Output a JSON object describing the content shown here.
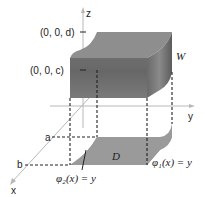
{
  "diagram": {
    "type": "3d-solid-region",
    "axes": {
      "x": "x",
      "y": "y",
      "z": "z"
    },
    "z_marks": {
      "upper": "(0, 0, d)",
      "lower": "(0, 0, c)"
    },
    "x_marks": {
      "near": "a",
      "far": "b"
    },
    "solid_label": "W",
    "region_label": "D",
    "curves": {
      "left": "φ₂(x) = y",
      "right": "φ₁(x) = y"
    },
    "colors": {
      "solid_top": "#8a8a8a",
      "solid_front": "#6e6e6e",
      "solid_side": "#5a5a5a",
      "region_fill": "#9a9a9a",
      "axis": "#b8b8b8",
      "dash": "#222222"
    }
  }
}
